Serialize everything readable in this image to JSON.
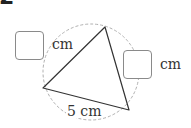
{
  "question": {
    "number": "2"
  },
  "figure": {
    "shape": "triangle-inscribed-in-circle",
    "circle_style": "dashed",
    "sides": [
      {
        "id": "left-top",
        "answer_box": true,
        "unit": "cm"
      },
      {
        "id": "top-right",
        "answer_box": true,
        "unit": "cm"
      },
      {
        "id": "bottom",
        "label": "5 cm"
      }
    ]
  },
  "labels": {
    "box1_unit": "cm",
    "box2_unit": "cm",
    "bottom_side": "5 cm"
  },
  "colors": {
    "line": "#333333",
    "circle": "#b0b0b0",
    "box_border": "#8a8a8a"
  }
}
